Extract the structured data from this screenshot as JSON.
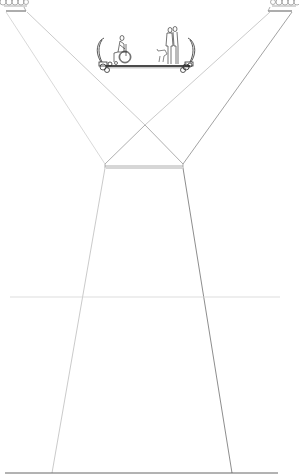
{
  "drawing": {
    "type": "architectural-section",
    "title": "Suspended accessible platform with lighting beams",
    "colors": {
      "background": "#ffffff",
      "light_line": "#c8c8c8",
      "mid_line": "#9a9a9a",
      "dark_line": "#555555",
      "figure_line": "#3a3a3a"
    },
    "elements": {
      "light_left": {
        "label": "stage-light-left",
        "x": 0,
        "y": 0
      },
      "light_right": {
        "label": "stage-light-right",
        "x": 271,
        "y": 0
      },
      "platform": {
        "label": "suspended-platform",
        "y": 66,
        "x_start": 103,
        "x_end": 192
      },
      "figures": [
        "wheelchair-user",
        "dog",
        "standing-person",
        "standing-person"
      ],
      "beam_crossing": {
        "x": 145,
        "y": 125
      },
      "crossbar": {
        "y": 167,
        "x_start": 105,
        "x_end": 183
      },
      "trapezoid": {
        "top_left": [
          105,
          168
        ],
        "top_right": [
          183,
          168
        ],
        "bottom_left": [
          52,
          473
        ],
        "bottom_right": [
          232,
          473
        ]
      },
      "mid_line": {
        "y": 297,
        "x_start": 10,
        "x_end": 280
      },
      "ground_line": {
        "y": 473,
        "x_start": 5,
        "x_end": 278
      }
    }
  }
}
